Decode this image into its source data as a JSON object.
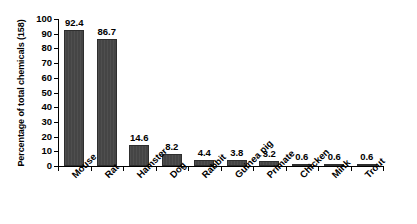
{
  "chart_data": {
    "type": "bar",
    "title": "",
    "xlabel": "",
    "ylabel": "Percentage of total chemicals (158)",
    "ylim": [
      0,
      100
    ],
    "ytick_step": 10,
    "yticks": [
      "0",
      "10",
      "20",
      "30",
      "40",
      "50",
      "60",
      "70",
      "80",
      "90",
      "100"
    ],
    "grid": false,
    "legend": false,
    "legend_position": "none",
    "bar_color": "#454545",
    "background_color": "#ffffff",
    "axis_color": "#000000",
    "xtick_placement": "category-boundaries",
    "xlabel_rotation_deg": -45,
    "value_labels_shown": true,
    "categories": [
      "Mouse",
      "Rat",
      "Hamster",
      "Dog",
      "Rabbit",
      "Guinea pig",
      "Primate",
      "Chicken",
      "Mink",
      "Trout"
    ],
    "values": [
      92.4,
      86.7,
      14.6,
      8.2,
      4.4,
      3.8,
      3.2,
      0.6,
      0.6,
      0.6
    ],
    "value_labels": [
      "92.4",
      "86.7",
      "14.6",
      "8.2",
      "4.4",
      "3.8",
      "3.2",
      "0.6",
      "0.6",
      "0.6"
    ]
  }
}
